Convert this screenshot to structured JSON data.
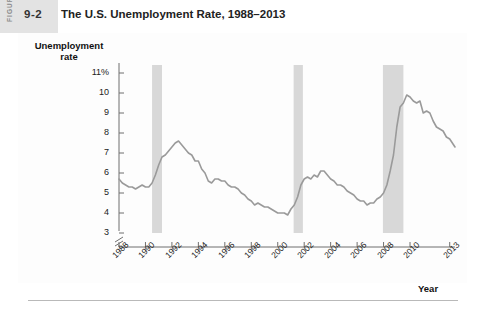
{
  "figure": {
    "rail_label": "FIGURE",
    "number": "9-2",
    "title": "The U.S. Unemployment Rate, 1988–2013"
  },
  "colors": {
    "line": "#9a9a9a",
    "recession_band": "#d8d8d8",
    "axis": "#6f6f6f",
    "rail": "#e3e3e3",
    "text": "#222222"
  },
  "chart_data": {
    "type": "line",
    "title": "The U.S. Unemployment Rate, 1988–2013",
    "xlabel": "Year",
    "ylabel": "Unemployment rate",
    "grid": false,
    "legend": "none",
    "axis_break_y": true,
    "ylim": [
      3,
      11
    ],
    "xlim": [
      1988,
      2013
    ],
    "ytick_labels": [
      "11%",
      "10",
      "9",
      "8",
      "7",
      "6",
      "5",
      "4",
      "3"
    ],
    "ytick_values": [
      11,
      10,
      9,
      8,
      7,
      6,
      5,
      4,
      3
    ],
    "xtick_labels": [
      "1988",
      "1990",
      "1992",
      "1994",
      "1996",
      "1998",
      "2000",
      "2002",
      "2004",
      "2006",
      "2008",
      "2010",
      "2013"
    ],
    "xtick_values": [
      1988,
      1990,
      1992,
      1994,
      1996,
      1998,
      2000,
      2002,
      2004,
      2006,
      2008,
      2010,
      2013
    ],
    "shaded_regions": [
      {
        "name": "recession-1990-1991",
        "x0": 1990.5,
        "x1": 1991.25
      },
      {
        "name": "recession-2001",
        "x0": 2001.2,
        "x1": 2001.9
      },
      {
        "name": "recession-2007-2009",
        "x0": 2007.95,
        "x1": 2009.5
      }
    ],
    "series": [
      {
        "name": "Unemployment rate",
        "x": [
          1988.0,
          1988.25,
          1988.5,
          1988.75,
          1989.0,
          1989.25,
          1989.5,
          1989.75,
          1990.0,
          1990.25,
          1990.5,
          1990.75,
          1991.0,
          1991.25,
          1991.5,
          1991.75,
          1992.0,
          1992.25,
          1992.5,
          1992.75,
          1993.0,
          1993.25,
          1993.5,
          1993.75,
          1994.0,
          1994.25,
          1994.5,
          1994.75,
          1995.0,
          1995.25,
          1995.5,
          1995.75,
          1996.0,
          1996.25,
          1996.5,
          1996.75,
          1997.0,
          1997.25,
          1997.5,
          1997.75,
          1998.0,
          1998.25,
          1998.5,
          1998.75,
          1999.0,
          1999.25,
          1999.5,
          1999.75,
          2000.0,
          2000.25,
          2000.5,
          2000.75,
          2001.0,
          2001.25,
          2001.5,
          2001.75,
          2002.0,
          2002.25,
          2002.5,
          2002.75,
          2003.0,
          2003.25,
          2003.5,
          2003.75,
          2004.0,
          2004.25,
          2004.5,
          2004.75,
          2005.0,
          2005.25,
          2005.5,
          2005.75,
          2006.0,
          2006.25,
          2006.5,
          2006.75,
          2007.0,
          2007.25,
          2007.5,
          2007.75,
          2008.0,
          2008.25,
          2008.5,
          2008.75,
          2009.0,
          2009.25,
          2009.5,
          2009.75,
          2010.0,
          2010.25,
          2010.5,
          2010.75,
          2011.0,
          2011.25,
          2011.5,
          2011.75,
          2012.0,
          2012.25,
          2012.5,
          2012.75,
          2013.0,
          2013.4
        ],
        "values": [
          5.7,
          5.5,
          5.4,
          5.3,
          5.3,
          5.2,
          5.3,
          5.4,
          5.3,
          5.3,
          5.5,
          5.9,
          6.4,
          6.8,
          6.9,
          7.1,
          7.3,
          7.5,
          7.6,
          7.4,
          7.2,
          7.0,
          6.9,
          6.6,
          6.6,
          6.2,
          6.0,
          5.6,
          5.5,
          5.7,
          5.7,
          5.6,
          5.6,
          5.4,
          5.3,
          5.3,
          5.2,
          5.0,
          4.9,
          4.7,
          4.6,
          4.4,
          4.5,
          4.4,
          4.3,
          4.3,
          4.2,
          4.1,
          4.0,
          4.0,
          4.0,
          3.9,
          4.2,
          4.4,
          4.8,
          5.4,
          5.7,
          5.8,
          5.7,
          5.9,
          5.8,
          6.1,
          6.1,
          5.9,
          5.7,
          5.6,
          5.4,
          5.4,
          5.3,
          5.1,
          5.0,
          4.9,
          4.7,
          4.6,
          4.6,
          4.4,
          4.5,
          4.5,
          4.7,
          4.8,
          5.0,
          5.4,
          6.1,
          6.9,
          8.3,
          9.3,
          9.5,
          9.9,
          9.8,
          9.6,
          9.5,
          9.6,
          9.0,
          9.1,
          9.0,
          8.6,
          8.3,
          8.2,
          8.1,
          7.8,
          7.7,
          7.3
        ]
      }
    ]
  }
}
